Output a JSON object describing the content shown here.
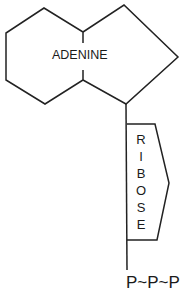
{
  "diagram": {
    "type": "molecule-schematic",
    "stroke_color": "#222222",
    "background": "#ffffff",
    "base": {
      "label": "ADENINE"
    },
    "sugar": {
      "label": "RIBOSE",
      "letters": [
        "R",
        "I",
        "B",
        "O",
        "S",
        "E"
      ]
    },
    "phosphates": {
      "label": "P~P~P"
    }
  }
}
